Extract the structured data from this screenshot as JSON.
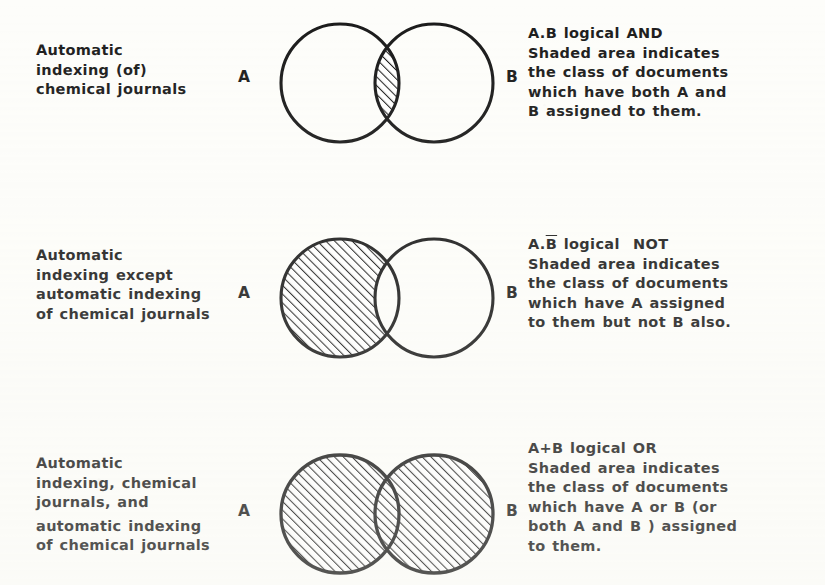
{
  "figure": {
    "background_color": "#fdfdfa",
    "ink_color": "#1a1a1a",
    "set_label_a": "A",
    "set_label_b": "B"
  },
  "rows": [
    {
      "id": "and",
      "operation": "AND",
      "query_lines": [
        "Automatic",
        "indexing (of)",
        "chemical  journals"
      ],
      "description_lines": [
        "A.B logical  AND",
        "Shaded  area indicates",
        "the class of  documents",
        "which  have both A and",
        "B assigned  to  them."
      ],
      "expression": "A.B",
      "shaded_region": "intersection",
      "label_a": "A",
      "label_b": "B"
    },
    {
      "id": "not",
      "operation": "NOT",
      "query_lines": [
        "Automatic",
        "indexing except",
        "automatic indexing",
        "of chemical journals"
      ],
      "description_lines": [
        "A.B logical  NOT",
        "Shaded  area indicates",
        "the  class of documents",
        "which  have  A  assigned",
        "to  them but  not  B  also."
      ],
      "expression": "A.B̅",
      "shaded_region": "a-minus-b",
      "label_a": "A",
      "label_b": "B"
    },
    {
      "id": "or",
      "operation": "OR",
      "query_lines": [
        "Automatic",
        "indexing, chemical",
        "journals, and",
        "automatic  indexing",
        "of chemical   journals"
      ],
      "description_lines": [
        "A+B  logical  OR",
        "Shaded  area indicates",
        "the  class  of  documents",
        "which  have  A or B (or",
        "both A and  B ) assigned",
        "to  them."
      ],
      "expression": "A+B",
      "shaded_region": "union",
      "label_a": "A",
      "label_b": "B"
    }
  ]
}
